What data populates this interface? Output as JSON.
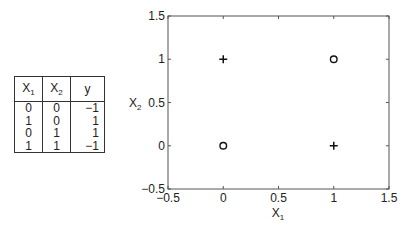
{
  "table": {
    "headers": [
      {
        "base": "X",
        "sub": "1"
      },
      {
        "base": "X",
        "sub": "2"
      },
      {
        "base": "y",
        "sub": ""
      }
    ],
    "rows": [
      [
        "0",
        "0",
        "−1"
      ],
      [
        "1",
        "0",
        "1"
      ],
      [
        "0",
        "1",
        "1"
      ],
      [
        "1",
        "1",
        "−1"
      ]
    ]
  },
  "chart_data": {
    "type": "scatter",
    "title": "",
    "xlabel": {
      "base": "X",
      "sub": "1"
    },
    "ylabel": {
      "base": "X",
      "sub": "2"
    },
    "xlim": [
      -0.5,
      1.5
    ],
    "ylim": [
      -0.5,
      1.5
    ],
    "xticks": [
      -0.5,
      0,
      0.5,
      1,
      1.5
    ],
    "yticks": [
      -0.5,
      0,
      0.5,
      1,
      1.5
    ],
    "xtick_labels": [
      "−0.5",
      "0",
      "0.5",
      "1",
      "1.5"
    ],
    "ytick_labels": [
      "−0.5",
      "0",
      "0.5",
      "1",
      "1.5"
    ],
    "grid": false,
    "series": [
      {
        "name": "y = 1",
        "marker": "plus",
        "points": [
          [
            1,
            0
          ],
          [
            0,
            1
          ]
        ]
      },
      {
        "name": "y = -1",
        "marker": "circle",
        "points": [
          [
            0,
            0
          ],
          [
            1,
            1
          ]
        ]
      }
    ]
  }
}
